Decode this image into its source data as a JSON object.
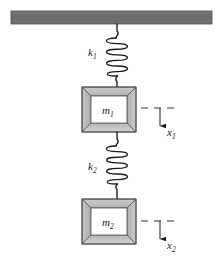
{
  "figure": {
    "background_color": "#ffffff",
    "ceiling": {
      "name": "fixed support ceiling",
      "fill_color": "#6e6e6e",
      "stroke_color": "#3a3a3a",
      "x": 11,
      "y": 11,
      "width": 201,
      "height": 13
    },
    "springs": [
      {
        "id": "spring-1",
        "label": "k",
        "subscript": "1",
        "label_x": 88,
        "label_y": 56,
        "coils": 6,
        "top_y": 24,
        "bottom_y": 87,
        "center_x": 117,
        "coil_rx": 13,
        "stroke_color": "#1a1a1a"
      },
      {
        "id": "spring-2",
        "label": "k",
        "subscript": "2",
        "label_x": 88,
        "label_y": 170,
        "coils": 6,
        "top_y": 132,
        "bottom_y": 199,
        "center_x": 117,
        "coil_rx": 13,
        "stroke_color": "#1a1a1a"
      }
    ],
    "masses": [
      {
        "id": "mass-1",
        "label": "m",
        "subscript": "1",
        "x": 82,
        "y": 87,
        "width": 54,
        "height": 45,
        "bevel": 9,
        "face_fill": "#ffffff",
        "frame_light": "#d0d0d0",
        "frame_mid": "#b8b8b8",
        "frame_dark": "#a0a0a0",
        "stroke_color": "#4a4a4a"
      },
      {
        "id": "mass-2",
        "label": "m",
        "subscript": "2",
        "x": 82,
        "y": 199,
        "width": 54,
        "height": 45,
        "bevel": 9,
        "face_fill": "#ffffff",
        "frame_light": "#d0d0d0",
        "frame_mid": "#b8b8b8",
        "frame_dark": "#a0a0a0",
        "stroke_color": "#4a4a4a"
      }
    ],
    "displacements": [
      {
        "id": "displacement-1",
        "label": "x",
        "subscript": "1",
        "label_x": 167,
        "label_y": 136,
        "datum_y": 108,
        "datum_x_start": 141,
        "datum_x_end": 178,
        "arrow_x": 160,
        "arrow_y_start": 108,
        "arrow_y_end": 131,
        "stroke_color": "#1a1a1a"
      },
      {
        "id": "displacement-2",
        "label": "x",
        "subscript": "2",
        "label_x": 167,
        "label_y": 249,
        "datum_y": 221,
        "datum_x_start": 141,
        "datum_x_end": 178,
        "arrow_x": 160,
        "arrow_y_start": 221,
        "arrow_y_end": 244,
        "stroke_color": "#1a1a1a"
      }
    ]
  }
}
